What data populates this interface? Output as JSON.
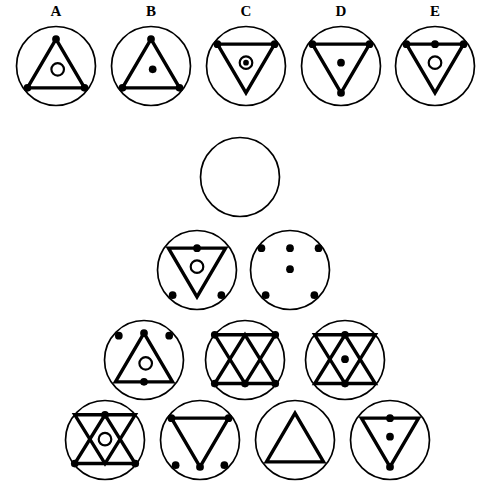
{
  "puzzle": {
    "type": "matrix-reasoning",
    "title": "",
    "answer_options": [
      {
        "label": "A",
        "x": 14,
        "y": 24,
        "size": 84,
        "shape": "triangle-up",
        "triangle": "up",
        "dots": [
          "triangle-top-vertex",
          "triangle-bottom-left-vertex",
          "triangle-bottom-right-vertex"
        ],
        "center": "open-circle"
      },
      {
        "label": "B",
        "x": 109,
        "y": 24,
        "size": 84,
        "shape": "triangle-up",
        "triangle": "up",
        "dots": [
          "triangle-top-vertex",
          "triangle-bottom-left-vertex",
          "triangle-bottom-right-vertex"
        ],
        "center": "filled-dot"
      },
      {
        "label": "C",
        "x": 204,
        "y": 24,
        "size": 84,
        "shape": "triangle-down",
        "triangle": "down",
        "dots": [
          "triangle-top-left-vertex",
          "triangle-top-right-vertex"
        ],
        "center": "circle-with-dot"
      },
      {
        "label": "D",
        "x": 299,
        "y": 24,
        "size": 84,
        "shape": "triangle-down",
        "triangle": "down",
        "dots": [
          "triangle-top-left-vertex",
          "triangle-top-right-vertex",
          "triangle-bottom-vertex"
        ],
        "center": "filled-dot"
      },
      {
        "label": "E",
        "x": 393,
        "y": 24,
        "size": 84,
        "shape": "triangle-down",
        "triangle": "down",
        "dots": [
          "triangle-top-left-vertex",
          "triangle-top-mid",
          "triangle-top-right-vertex"
        ],
        "center": "open-circle"
      }
    ],
    "matrix_cells": [
      {
        "row": 1,
        "col": 1,
        "x": 198,
        "y": 135,
        "size": 84,
        "shape": "empty",
        "triangle": "none",
        "dots": [],
        "center": "none",
        "is_missing": true
      },
      {
        "row": 2,
        "col": 1,
        "x": 155,
        "y": 228,
        "size": 84,
        "shape": "triangle-down",
        "triangle": "down",
        "dots": [
          "triangle-top-mid",
          "outer-bottom-left",
          "outer-bottom-right"
        ],
        "center": "open-circle",
        "is_missing": false
      },
      {
        "row": 2,
        "col": 2,
        "x": 248,
        "y": 228,
        "size": 84,
        "shape": "dots-only",
        "triangle": "none",
        "dots": [
          "triangle-top-left-vertex",
          "triangle-top-mid",
          "triangle-top-right-vertex",
          "outer-bottom-left",
          "outer-bottom-right"
        ],
        "center": "filled-dot",
        "is_missing": false
      },
      {
        "row": 3,
        "col": 1,
        "x": 102,
        "y": 318,
        "size": 84,
        "shape": "triangle-up",
        "triangle": "up",
        "dots": [
          "triangle-top-vertex",
          "triangle-bottom-mid",
          "outer-top-left",
          "outer-top-right"
        ],
        "center": "open-circle",
        "is_missing": false
      },
      {
        "row": 3,
        "col": 2,
        "x": 203,
        "y": 318,
        "size": 84,
        "shape": "hexagram",
        "triangle": "both",
        "dots": [
          "hex-top-left",
          "hex-top-right",
          "hex-bottom-left",
          "hex-bottom-right",
          "hex-bottom-mid"
        ],
        "center": "none",
        "is_missing": false
      },
      {
        "row": 3,
        "col": 3,
        "x": 303,
        "y": 318,
        "size": 84,
        "shape": "hexagram",
        "triangle": "both",
        "dots": [
          "hex-top-mid",
          "hex-bottom-mid"
        ],
        "center": "filled-dot",
        "is_missing": false
      },
      {
        "row": 4,
        "col": 1,
        "x": 63,
        "y": 398,
        "size": 84,
        "shape": "hexagram",
        "triangle": "both",
        "dots": [
          "hex-top-mid",
          "hex-bottom-left",
          "hex-bottom-right"
        ],
        "center": "open-circle",
        "is_missing": false
      },
      {
        "row": 4,
        "col": 2,
        "x": 158,
        "y": 398,
        "size": 84,
        "shape": "triangle-down",
        "triangle": "down",
        "dots": [
          "triangle-top-left-vertex",
          "triangle-top-right-vertex",
          "triangle-bottom-vertex",
          "outer-bottom-left",
          "outer-bottom-right"
        ],
        "center": "none",
        "is_missing": false
      },
      {
        "row": 4,
        "col": 3,
        "x": 253,
        "y": 398,
        "size": 84,
        "shape": "triangle-up",
        "triangle": "up",
        "dots": [],
        "center": "none",
        "is_missing": false
      },
      {
        "row": 4,
        "col": 4,
        "x": 348,
        "y": 398,
        "size": 84,
        "shape": "triangle-down",
        "triangle": "down",
        "dots": [
          "triangle-top-mid",
          "triangle-bottom-vertex"
        ],
        "center": "filled-dot",
        "is_missing": false
      }
    ],
    "colors": {
      "stroke": "#000000",
      "fill": "#000000",
      "background": "#ffffff"
    }
  }
}
